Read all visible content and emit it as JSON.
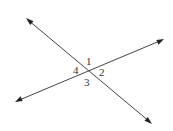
{
  "diagram": {
    "title": "",
    "lines": [
      {
        "name": "line-a",
        "from": [
          26,
          18
        ],
        "to": [
          152,
          124
        ]
      },
      {
        "name": "line-b",
        "from": [
          15,
          102
        ],
        "to": [
          164,
          39
        ]
      }
    ],
    "intersection": [
      88,
      71
    ],
    "angle_labels": [
      {
        "id": "1",
        "text": "1",
        "x": 86,
        "y": 65
      },
      {
        "id": "2",
        "text": "2",
        "x": 99,
        "y": 76
      },
      {
        "id": "3",
        "text": "3",
        "x": 84,
        "y": 86
      },
      {
        "id": "4",
        "text": "4",
        "x": 73,
        "y": 74
      }
    ],
    "colors": {
      "line": "#444444",
      "arrow": "#222222",
      "text": "#333333",
      "background": "#ffffff"
    }
  }
}
